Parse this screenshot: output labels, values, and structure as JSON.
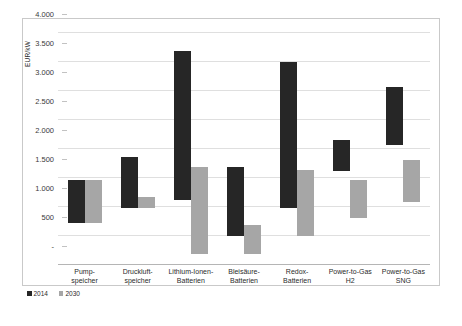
{
  "chart_data": {
    "type": "bar",
    "subtype": "floating-range-bar",
    "title": "",
    "xlabel": "",
    "ylabel": "EUR/kW",
    "ylim": [
      0,
      4000
    ],
    "ytick_values": [
      0,
      500,
      1000,
      1500,
      2000,
      2500,
      3000,
      3500,
      4000
    ],
    "ytick_labels": [
      "-",
      "500",
      "1.000",
      "1.500",
      "2.000",
      "2.500",
      "3.000",
      "3.500",
      "4.000"
    ],
    "grid": true,
    "legend_position": "bottom-left",
    "categories": [
      "Pump-\nspeicher",
      "Druckluft-\nspeicher",
      "Lithium-Ionen-\nBatterien",
      "Bleisäure-\nBatterien",
      "Redox-\nBatterien",
      "Power-to-Gas\nH2",
      "Power-to-Gas\nSNG"
    ],
    "series": [
      {
        "name": "2014",
        "color": "#262626",
        "low": [
          700,
          970,
          1100,
          480,
          970,
          1600,
          2050
        ],
        "high": [
          1450,
          1850,
          3680,
          1680,
          3480,
          2130,
          3050
        ]
      },
      {
        "name": "2030",
        "color": "#a6a6a6",
        "low": [
          700,
          970,
          180,
          180,
          480,
          790,
          1070
        ],
        "high": [
          1450,
          1150,
          1680,
          680,
          1620,
          1450,
          1790
        ]
      }
    ]
  },
  "legend": {
    "items": [
      {
        "label": "2014",
        "color": "#262626"
      },
      {
        "label": "2030",
        "color": "#a6a6a6"
      }
    ]
  }
}
